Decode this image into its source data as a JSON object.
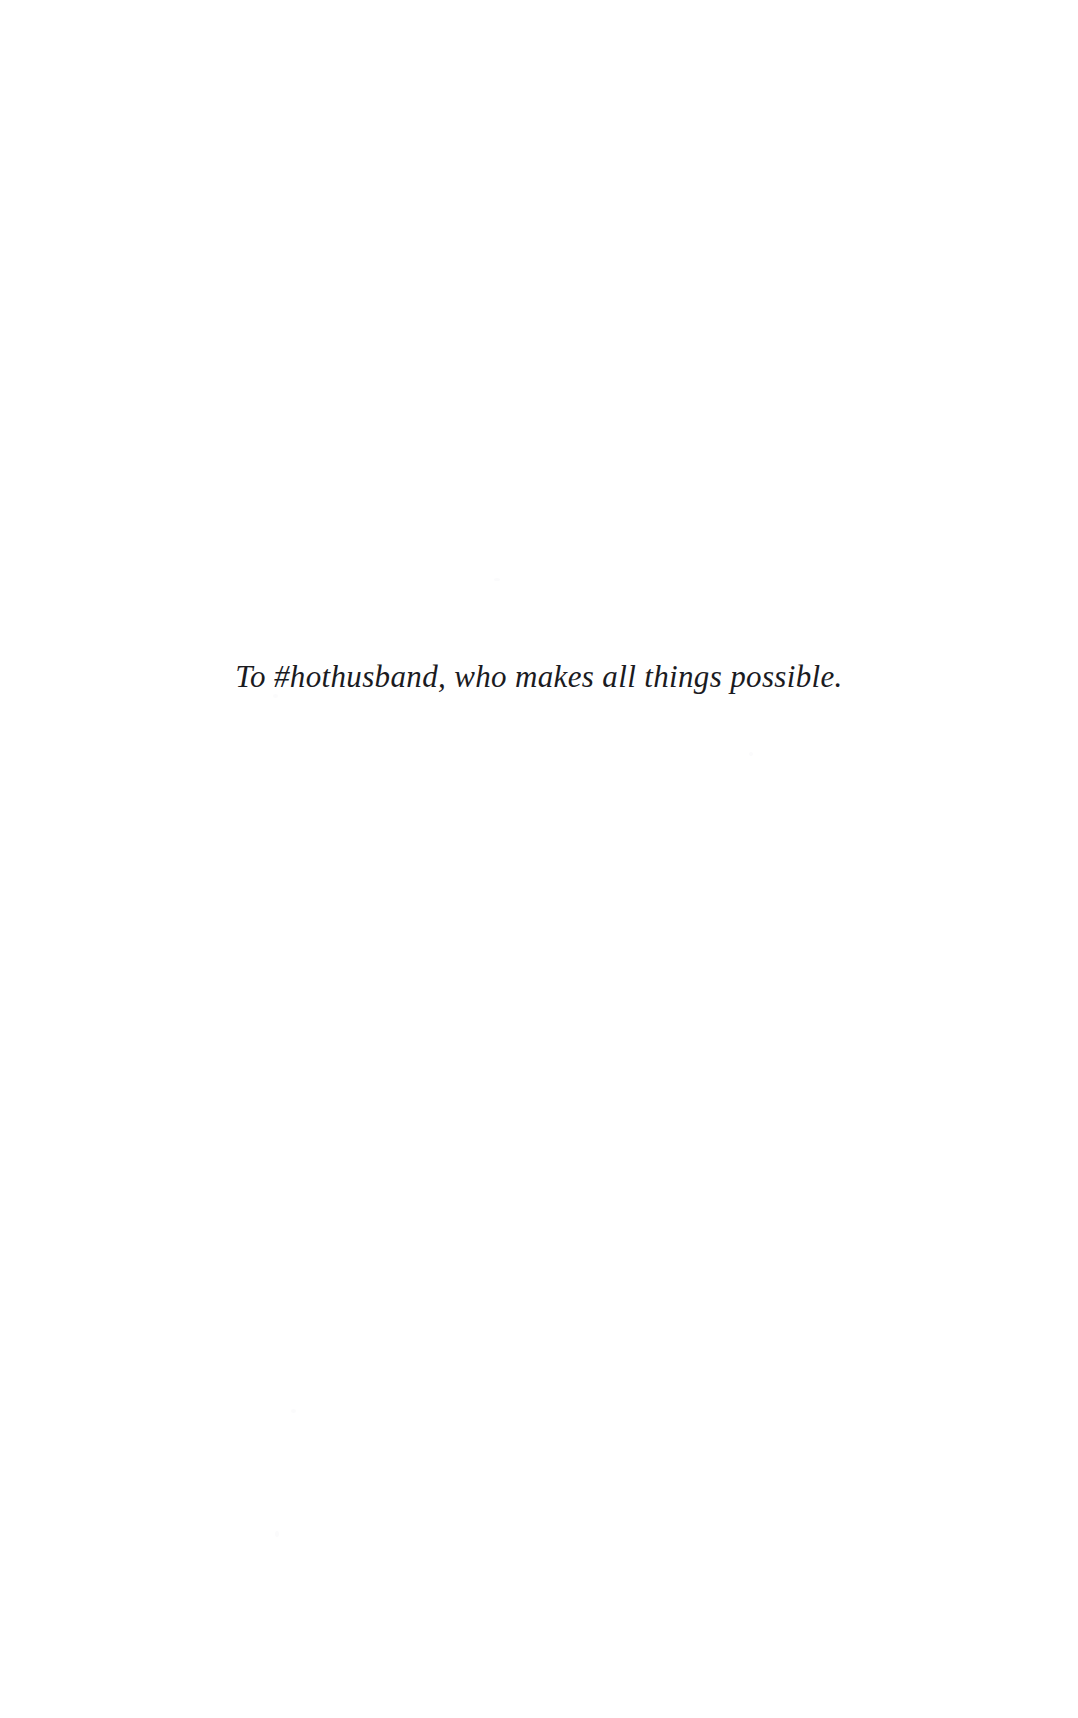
{
  "page": {
    "kind": "book-dedication-page",
    "background_color": "#ffffff",
    "text_color": "#1b1b1f",
    "width_px": 1078,
    "height_px": 1718
  },
  "dedication": {
    "text": "To #hothusband, who makes all things possible.",
    "style": "italic-serif",
    "alignment": "center"
  }
}
